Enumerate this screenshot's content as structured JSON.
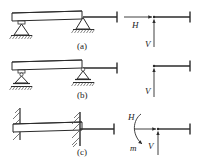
{
  "figure": {
    "stroke_color": "#2b2b2b",
    "hatch_color": "#555555",
    "beam_fill": "#ffffff",
    "background": "#ffffff",
    "rows": [
      {
        "id": "a",
        "label": "(a)",
        "support_type": "pinned",
        "physical_caption": "",
        "reactions": [
          "H",
          "V"
        ]
      },
      {
        "id": "b",
        "label": "(b)",
        "support_type": "roller",
        "physical_caption": "",
        "reactions": [
          "V"
        ]
      },
      {
        "id": "c",
        "label": "(c)",
        "support_type": "fixed",
        "physical_caption": "",
        "reactions": [
          "H",
          "V",
          "m"
        ]
      }
    ],
    "labels": {
      "row_a": "(a)",
      "row_b": "(b)",
      "row_c": "(c)",
      "H_a": "H",
      "V_a": "V",
      "V_b": "V",
      "H_c": "H",
      "V_c": "V",
      "m_c": "m"
    }
  }
}
